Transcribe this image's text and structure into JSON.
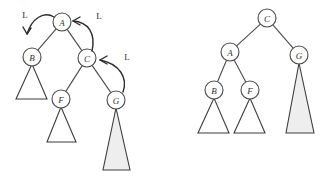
{
  "diagram": {
    "colors": {
      "node_stroke": "#4a4a4a",
      "node_fill": "#ffffff",
      "edge": "#4a4a4a",
      "arrow": "#2b2b2b",
      "subtree_fill": "#ffffff",
      "subtree_shaded_fill": "#eeeeee",
      "background": "#ffffff"
    },
    "left_tree": {
      "name": "before-rotation-tree",
      "nodes": [
        {
          "id": "A",
          "label": "A",
          "cx": 62,
          "cy": 22,
          "r": 9
        },
        {
          "id": "B",
          "label": "B",
          "cx": 32,
          "cy": 57,
          "r": 9
        },
        {
          "id": "C",
          "label": "C",
          "cx": 87,
          "cy": 58,
          "r": 9
        },
        {
          "id": "F",
          "label": "F",
          "cx": 61,
          "cy": 99,
          "r": 9
        },
        {
          "id": "G",
          "label": "G",
          "cx": 116,
          "cy": 100,
          "r": 9
        }
      ],
      "edges": [
        {
          "from": "A",
          "to": "B"
        },
        {
          "from": "A",
          "to": "C"
        },
        {
          "from": "C",
          "to": "F"
        },
        {
          "from": "C",
          "to": "G"
        }
      ],
      "subtrees": [
        {
          "parent": "B",
          "apex_x": 32,
          "apex_y": 64,
          "base_y": 99,
          "base_left_x": 16,
          "base_right_x": 47,
          "shaded": false
        },
        {
          "parent": "F",
          "apex_x": 61,
          "apex_y": 107,
          "base_y": 142,
          "base_left_x": 47,
          "base_right_x": 76,
          "shaded": false
        },
        {
          "parent": "G",
          "apex_x": 116,
          "apex_y": 108,
          "base_y": 170,
          "base_left_x": 103,
          "base_right_x": 130,
          "shaded": true
        }
      ],
      "rotation_arrows": [
        {
          "id": "arrow-a-to-b",
          "label": "L",
          "label_x": 25,
          "label_y": 15,
          "path": "M 54 17 C 44 11, 32 18, 27 34",
          "head": "M 27 34 L 23 27 M 27 34 L 31 28"
        },
        {
          "id": "arrow-c-to-a",
          "label": "L",
          "label_x": 99,
          "label_y": 16,
          "path": "M 92 51 C 96 33, 88 22, 73 21",
          "head": "M 73 21 L 80 17 M 73 21 L 80 25"
        },
        {
          "id": "arrow-g-to-c",
          "label": "L",
          "label_x": 127,
          "label_y": 57,
          "path": "M 123 92 C 128 78, 120 64, 100 60",
          "head": "M 100 60 L 107 56 M 100 60 L 107 64"
        }
      ]
    },
    "right_tree": {
      "name": "after-rotation-tree",
      "nodes": [
        {
          "id": "C",
          "label": "C",
          "cx": 267,
          "cy": 18,
          "r": 9
        },
        {
          "id": "A",
          "label": "A",
          "cx": 230,
          "cy": 52,
          "r": 9
        },
        {
          "id": "G",
          "label": "G",
          "cx": 299,
          "cy": 55,
          "r": 9
        },
        {
          "id": "B",
          "label": "B",
          "cx": 214,
          "cy": 90,
          "r": 9
        },
        {
          "id": "F",
          "label": "F",
          "cx": 250,
          "cy": 90,
          "r": 9
        }
      ],
      "edges": [
        {
          "from": "C",
          "to": "A"
        },
        {
          "from": "C",
          "to": "G"
        },
        {
          "from": "A",
          "to": "B"
        },
        {
          "from": "A",
          "to": "F"
        }
      ],
      "subtrees": [
        {
          "parent": "B",
          "apex_x": 214,
          "apex_y": 98,
          "base_y": 133,
          "base_left_x": 198,
          "base_right_x": 229,
          "shaded": false
        },
        {
          "parent": "F",
          "apex_x": 250,
          "apex_y": 98,
          "base_y": 133,
          "base_left_x": 234,
          "base_right_x": 265,
          "shaded": false
        },
        {
          "parent": "G",
          "apex_x": 299,
          "apex_y": 63,
          "base_y": 133,
          "base_left_x": 286,
          "base_right_x": 314,
          "shaded": true
        }
      ]
    }
  }
}
